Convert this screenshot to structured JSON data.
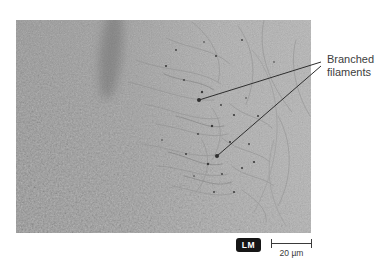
{
  "figure": {
    "annotation_label": "Branched filaments",
    "type_badge": "LM",
    "scale_label": "20 µm"
  },
  "colors": {
    "background": "#ffffff",
    "annotation_text": "#3d3d3d",
    "leader_line": "#2e2e2e",
    "badge_background": "#161616",
    "badge_text": "#ffffff",
    "scale_bar": "#3a3a3a",
    "micrograph_left_tone": "#989898",
    "micrograph_right_tone": "#b6b6b6"
  }
}
